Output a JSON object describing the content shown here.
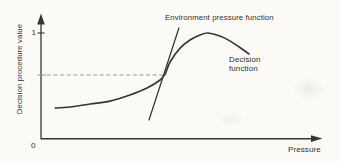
{
  "chart_data": {
    "type": "line",
    "title": "",
    "xlabel": "Pressure",
    "ylabel": "Decision procedure value",
    "x_range": [
      0,
      1
    ],
    "y_range": [
      0,
      1.1
    ],
    "grid": false,
    "y_ticks": [
      {
        "value": 1,
        "label": "1"
      }
    ],
    "origin_label": "0",
    "legend": "inline-annotations",
    "series": [
      {
        "name": "Decision function",
        "style": "smooth-curve",
        "points": [
          [
            0.051,
            0.292
          ],
          [
            0.105,
            0.302
          ],
          [
            0.177,
            0.33
          ],
          [
            0.249,
            0.358
          ],
          [
            0.321,
            0.415
          ],
          [
            0.383,
            0.481
          ],
          [
            0.43,
            0.557
          ],
          [
            0.448,
            0.613
          ],
          [
            0.466,
            0.726
          ],
          [
            0.502,
            0.858
          ],
          [
            0.538,
            0.934
          ],
          [
            0.574,
            0.981
          ],
          [
            0.603,
            1.0
          ],
          [
            0.646,
            0.972
          ],
          [
            0.682,
            0.925
          ],
          [
            0.718,
            0.863
          ],
          [
            0.751,
            0.802
          ]
        ]
      },
      {
        "name": "Environment pressure function",
        "style": "straight-line",
        "points": [
          [
            0.39,
            0.179
          ],
          [
            0.498,
            1.047
          ]
        ]
      }
    ],
    "dashed_guide": {
      "y": 0.604,
      "x_from": 0.0,
      "x_to": 0.455
    }
  },
  "colors": {
    "ink": "#383530",
    "dashed": "#9a958d",
    "text": "#33302b",
    "background": "#fbfaf7"
  }
}
